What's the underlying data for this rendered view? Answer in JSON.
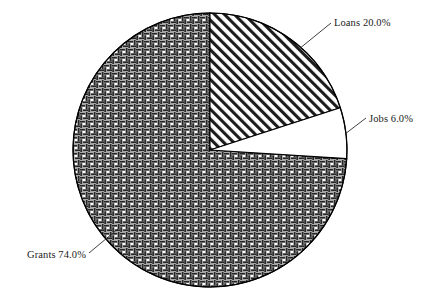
{
  "chart_data": {
    "type": "pie",
    "title": "",
    "subtitle": "",
    "xlabel": "",
    "ylabel": "",
    "legend_position": "none",
    "grid": false,
    "start_angle_deg": 90,
    "direction": "clockwise",
    "units": "percent",
    "categories": [
      "Loans",
      "Jobs",
      "Grants"
    ],
    "values": [
      20.0,
      6.0,
      74.0
    ],
    "labels": [
      "Loans 20.0%",
      "Jobs 6.0%",
      "Grants 74.0%"
    ],
    "slices": [
      {
        "name": "Loans",
        "value": 20.0,
        "label": "Loans 20.0%",
        "percent_text": "20.0%",
        "fill_style": "diagonal-stripes",
        "fill_color": "#ffffff",
        "hatch_color": "#1c1c1c",
        "start_deg": 0.0,
        "end_deg": 72.0
      },
      {
        "name": "Jobs",
        "value": 6.0,
        "label": "Jobs 6.0%",
        "percent_text": "6.0%",
        "fill_style": "solid-white",
        "fill_color": "#ffffff",
        "hatch_color": "#000000",
        "start_deg": 72.0,
        "end_deg": 93.6
      },
      {
        "name": "Grants",
        "value": 74.0,
        "label": "Grants 74.0%",
        "percent_text": "74.0%",
        "fill_style": "basket-weave-crosshatch",
        "fill_color": "#ffffff",
        "hatch_color": "#262626",
        "start_deg": 93.6,
        "end_deg": 360.0
      }
    ]
  },
  "figure": {
    "background_color": "#ffffff",
    "outline_color": "#000000",
    "text_color": "#1a1a1a",
    "center_x": 210,
    "center_y": 150,
    "radius": 137
  },
  "labels": {
    "loans": "Loans 20.0%",
    "jobs": "Jobs 6.0%",
    "grants": "Grants 74.0%"
  }
}
